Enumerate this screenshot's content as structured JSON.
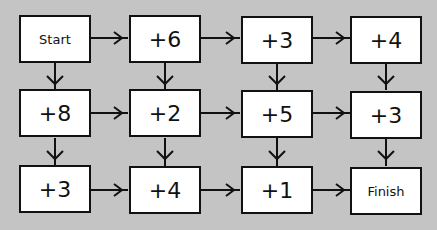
{
  "diagram": {
    "type": "flow-grid",
    "rows": [
      [
        "Start",
        "+6",
        "+3",
        "+4"
      ],
      [
        "+8",
        "+2",
        "+5",
        "+3"
      ],
      [
        "+3",
        "+4",
        "+1",
        "Finish"
      ]
    ],
    "arrows": "right between adjacent boxes in each row; down between adjacent boxes in each column",
    "colors": {
      "background": "#c4c4c4",
      "box_fill": "#ffffff",
      "stroke": "#111111"
    }
  }
}
